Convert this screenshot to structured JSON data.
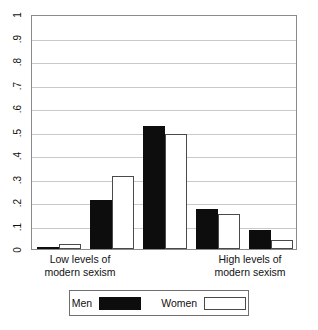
{
  "chart_data": {
    "type": "bar",
    "title": "",
    "subtitle": "",
    "xlabel": "",
    "ylabel": "",
    "ylim": [
      0,
      1
    ],
    "grid": true,
    "legend_position": "bottom",
    "categories": [
      "1",
      "2",
      "3",
      "4",
      "5"
    ],
    "category_axis_labels": {
      "left": "Low levels of\nmodern sexism",
      "right": "High levels of\nmodern sexism"
    },
    "ytick_labels": [
      "0",
      ".1",
      ".2",
      ".3",
      ".4",
      ".5",
      ".6",
      ".7",
      ".8",
      ".9",
      "1"
    ],
    "ytick_values": [
      0,
      0.1,
      0.2,
      0.3,
      0.4,
      0.5,
      0.6,
      0.7,
      0.8,
      0.9,
      1
    ],
    "series": [
      {
        "name": "Men",
        "color": "#0d0d0d",
        "values": [
          0.01,
          0.21,
          0.525,
          0.17,
          0.08
        ]
      },
      {
        "name": "Women",
        "color": "#ffffff",
        "values": [
          0.02,
          0.31,
          0.49,
          0.15,
          0.04
        ]
      }
    ]
  },
  "legend": {
    "men_label": "Men",
    "women_label": "Women"
  },
  "axis": {
    "x_left_label": "Low levels of\nmodern sexism",
    "x_right_label": "High levels of\nmodern sexism"
  }
}
